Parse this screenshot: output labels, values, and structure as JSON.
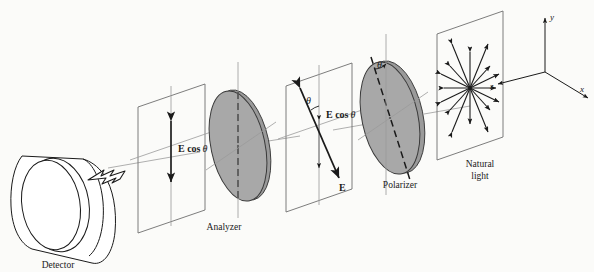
{
  "figure": {
    "kind": "optics-diagram",
    "background_color": "#fbfbf9",
    "ink_color": "#1a1a1a",
    "disc_fill_color": "#a8a8a8",
    "disc_edge_color": "#3a3a3a",
    "ray_color": "#8a8a8a"
  },
  "labels": {
    "detector": "Detector",
    "analyzer": "Analyzer",
    "polarizer": "Polarizer",
    "natural_light_line1": "Natural",
    "natural_light_line2": "light",
    "e_cos_theta_left": "E cos",
    "e_cos_theta_mid": "E cos",
    "theta_symbol": "θ",
    "e_vector": "E",
    "theta_polarizer": "θ",
    "theta_mid_plane": "θ"
  },
  "axes": {
    "y_label": "y",
    "z_label": "z",
    "x_label": "x"
  },
  "components": [
    {
      "name": "detector",
      "label": "Detector",
      "type": "cylinder"
    },
    {
      "name": "transmitted-plane",
      "label": "E cos θ",
      "type": "plane-with-vertical-vector"
    },
    {
      "name": "analyzer",
      "label": "Analyzer",
      "type": "disc",
      "axis": "vertical-dashed"
    },
    {
      "name": "incident-plane",
      "label": "E",
      "type": "plane-with-tilted-vector"
    },
    {
      "name": "polarizer",
      "label": "Polarizer",
      "type": "disc",
      "axis": "tilted-dashed"
    },
    {
      "name": "natural-light-plane",
      "label": "Natural light",
      "type": "plane-with-radial-arrows"
    },
    {
      "name": "coordinate-axes",
      "label": "x y z",
      "type": "axes"
    }
  ],
  "natural_light": {
    "ray_count": 8,
    "description": "radial double-headed arrows showing unpolarized light"
  }
}
